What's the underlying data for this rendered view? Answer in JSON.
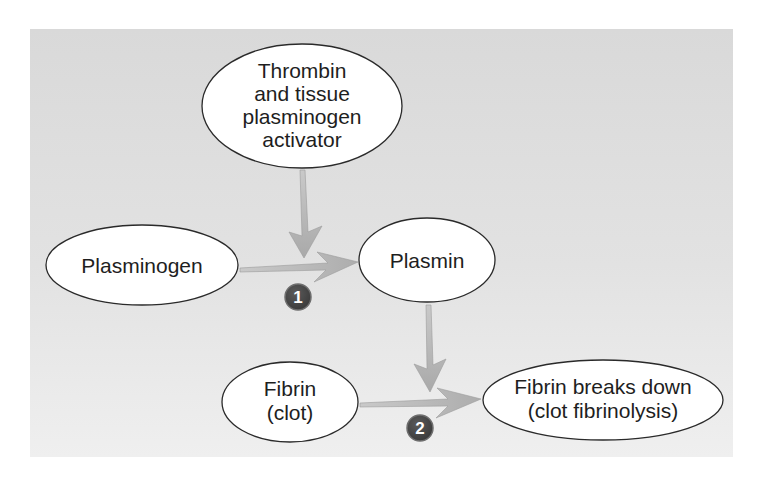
{
  "diagram": {
    "type": "flowchart",
    "title": "",
    "background_color": "#dedede",
    "node_fill": "#ffffff",
    "node_stroke": "#2a2a2a",
    "arrow_color": "#b9b9b9",
    "badge_color": "#4a4a4a",
    "nodes": [
      {
        "id": "activator",
        "lines": [
          "Thrombin",
          "and tissue",
          "plasminogen",
          "activator"
        ]
      },
      {
        "id": "plasminogen",
        "lines": [
          "Plasminogen"
        ]
      },
      {
        "id": "plasmin",
        "lines": [
          "Plasmin"
        ]
      },
      {
        "id": "fibrin",
        "lines": [
          "Fibrin",
          "(clot)"
        ]
      },
      {
        "id": "fibrinolysis",
        "lines": [
          "Fibrin breaks down",
          "(clot fibrinolysis)"
        ]
      }
    ],
    "edges": [
      {
        "from": "plasminogen",
        "to": "plasmin",
        "step": "1"
      },
      {
        "from": "activator",
        "to": "edge-1",
        "note": "acts on step 1"
      },
      {
        "from": "fibrin",
        "to": "fibrinolysis",
        "step": "2"
      },
      {
        "from": "plasmin",
        "to": "edge-2",
        "note": "acts on step 2"
      }
    ],
    "badges": [
      {
        "label": "1"
      },
      {
        "label": "2"
      }
    ]
  }
}
